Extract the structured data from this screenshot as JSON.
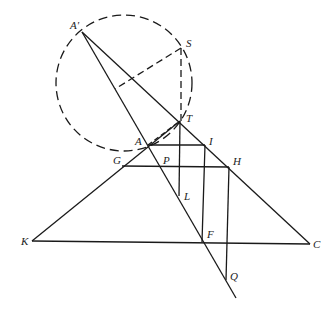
{
  "diagram": {
    "type": "geometry-construction",
    "colors": {
      "stroke": "#1a1a1a",
      "background": "#ffffff"
    },
    "labels": {
      "A_prime": "A'",
      "S": "S",
      "T": "T",
      "A": "A",
      "I": "I",
      "G": "G",
      "P": "P",
      "H": "H",
      "L": "L",
      "K": "K",
      "F": "F",
      "C": "C",
      "Q": "Q"
    },
    "points": {
      "A_prime": [
        82,
        32
      ],
      "S": [
        181,
        48
      ],
      "T": [
        180,
        121
      ],
      "A": [
        148,
        145
      ],
      "I": [
        205,
        145
      ],
      "G": [
        122,
        166
      ],
      "P": [
        160,
        166
      ],
      "H": [
        229,
        167
      ],
      "L": [
        180,
        196
      ],
      "K": [
        32,
        241
      ],
      "F": [
        202,
        242
      ],
      "C": [
        310,
        244
      ],
      "Q": [
        226,
        280
      ]
    },
    "circle": {
      "center": [
        124,
        82
      ],
      "radius": 68,
      "style": "dashed"
    }
  }
}
